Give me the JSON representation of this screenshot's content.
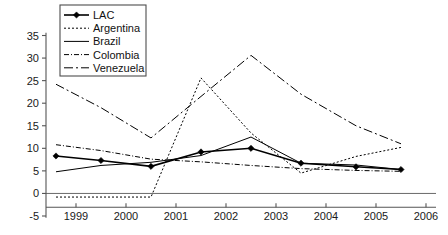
{
  "chart_data": {
    "type": "line",
    "title": "",
    "xlabel": "",
    "ylabel": "",
    "xlim": [
      1998.4,
      2006.2
    ],
    "ylim": [
      -5,
      36
    ],
    "grid": false,
    "legend_position": "top-left",
    "x_ticks": [
      "1999",
      "2000",
      "2001",
      "2002",
      "2003",
      "2004",
      "2005",
      "2006"
    ],
    "y_ticks": [
      "-5",
      "0",
      "5",
      "10",
      "15",
      "20",
      "25",
      "30",
      "35"
    ],
    "x_tick_values": [
      1999,
      2000,
      2001,
      2002,
      2003,
      2004,
      2005,
      2006
    ],
    "y_tick_values": [
      -5,
      0,
      5,
      10,
      15,
      20,
      25,
      30,
      35
    ],
    "x_values": [
      1998.6,
      1999.5,
      2000.5,
      2001.5,
      2002.5,
      2003.5,
      2004.6,
      2005.5
    ],
    "series": [
      {
        "name": "LAC",
        "style": "solid-marker",
        "stroke_width": 1.6,
        "dash": "none",
        "marker": "diamond",
        "values": [
          8.3,
          7.3,
          6.0,
          9.2,
          10.0,
          6.7,
          5.9,
          5.3
        ]
      },
      {
        "name": "Argentina",
        "style": "dotted",
        "stroke_width": 1.0,
        "dash": "2,2",
        "marker": "none",
        "values": [
          -0.8,
          -0.8,
          -0.8,
          25.6,
          13.4,
          4.5,
          8.2,
          10.2
        ]
      },
      {
        "name": "Brazil",
        "style": "solid",
        "stroke_width": 1.0,
        "dash": "none",
        "marker": "none",
        "values": [
          4.8,
          6.2,
          6.9,
          8.4,
          12.5,
          6.7,
          6.3,
          5.3
        ]
      },
      {
        "name": "Colombia",
        "style": "dash-dot-short",
        "stroke_width": 1.0,
        "dash": "5,2,1,2",
        "marker": "none",
        "values": [
          10.8,
          9.5,
          7.6,
          7.0,
          6.2,
          5.5,
          5.1,
          4.9
        ]
      },
      {
        "name": "Venezuela",
        "style": "dash-dot-long",
        "stroke_width": 1.0,
        "dash": "9,3,2,3",
        "marker": "none",
        "values": [
          24.2,
          19.0,
          12.3,
          21.5,
          30.6,
          22.0,
          15.0,
          11.0
        ]
      }
    ]
  },
  "legend": {
    "items": [
      {
        "label": "LAC"
      },
      {
        "label": "Argentina"
      },
      {
        "label": "Brazil"
      },
      {
        "label": "Colombia"
      },
      {
        "label": "Venezuela"
      }
    ]
  },
  "colors": {
    "ink": "#000000",
    "axis": "#555555",
    "background": "#ffffff"
  }
}
